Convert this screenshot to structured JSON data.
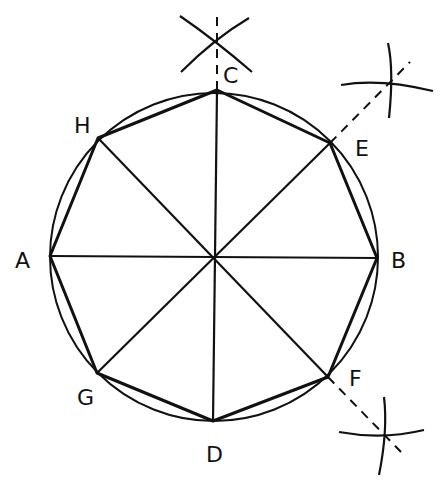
{
  "diagram": {
    "labels": {
      "A": "A",
      "B": "B",
      "C": "C",
      "D": "D",
      "E": "E",
      "F": "F",
      "G": "G",
      "H": "H"
    },
    "colors": {
      "stroke": "#111111",
      "background": "#ffffff"
    }
  }
}
